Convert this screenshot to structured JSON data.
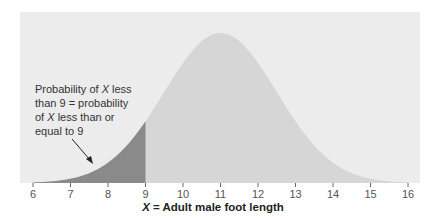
{
  "chart_data": {
    "type": "area",
    "title": "",
    "distribution": "normal",
    "mean": 11,
    "sd": 1.5,
    "xlabel_var": "X",
    "xlabel_rest": " = Adult male foot length",
    "xlabel": "X = Adult male foot length",
    "ylabel": "",
    "xlim": [
      6,
      16
    ],
    "x_ticks": [
      6,
      7,
      8,
      9,
      10,
      11,
      12,
      13,
      14,
      15,
      16
    ],
    "shaded_region": {
      "from": 6,
      "to": 9,
      "meaning": "P(X < 9) = P(X <= 9)"
    },
    "annotation": {
      "lines": [
        {
          "pre": "Probability of ",
          "var": "X",
          "post": " less"
        },
        {
          "pre": "than 9 = probability",
          "var": "",
          "post": ""
        },
        {
          "pre": "of ",
          "var": "X",
          "post": " less than or"
        },
        {
          "pre": "equal to 9",
          "var": "",
          "post": ""
        }
      ]
    },
    "grid": false,
    "legend": null
  },
  "colors": {
    "panel": "#ececec",
    "curve_fill": "#d6d6d6",
    "shaded_fill": "#8a8a8a",
    "axis_text": "#555555"
  }
}
